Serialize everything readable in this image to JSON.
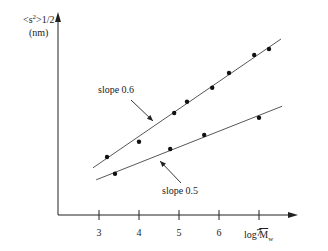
{
  "chart_data": {
    "type": "scatter",
    "title": "",
    "xlabel": "log M̄w",
    "xlabel_parts": {
      "prefix": "log ",
      "main": "M",
      "sub": "w"
    },
    "ylabel": "<s2>1/2 (nm)",
    "ylabel_parts": {
      "line1_pre": "<s",
      "line1_sup": "2",
      "line1_post": ">1/2",
      "line2": "(nm)"
    },
    "x_ticks": [
      3,
      4,
      5,
      6,
      7
    ],
    "x_tick_labels": [
      "3",
      "4",
      "5",
      "6",
      "7"
    ],
    "y_ticks": [],
    "xlim": [
      1.05,
      7.7
    ],
    "ylim_arbitrary": [
      0,
      5.0
    ],
    "grid": false,
    "legend": null,
    "series": [
      {
        "name": "slope 0.6",
        "slope": 0.6,
        "x": [
          3.2,
          4.0,
          4.88,
          5.2,
          5.83,
          6.25,
          6.88,
          7.25
        ],
        "y": [
          1.45,
          1.83,
          2.55,
          2.83,
          3.18,
          3.55,
          4.0,
          4.15
        ],
        "fit_line": {
          "x": [
            2.85,
            7.55
          ],
          "y": [
            1.18,
            4.4
          ]
        }
      },
      {
        "name": "slope 0.5",
        "slope": 0.5,
        "x": [
          3.4,
          4.78,
          5.63,
          7.0
        ],
        "y": [
          1.03,
          1.65,
          2.0,
          2.43
        ],
        "fit_line": {
          "x": [
            2.93,
            7.58
          ],
          "y": [
            0.88,
            2.72
          ]
        }
      }
    ],
    "annotations": [
      {
        "text": "slope 0.6",
        "arrow_to_series": "slope 0.6"
      },
      {
        "text": "slope 0.5",
        "arrow_to_series": "slope 0.5"
      }
    ]
  },
  "labels": {
    "slope_upper": "slope 0.6",
    "slope_lower": "slope 0.5"
  },
  "colors": {
    "ink": "#222222",
    "background": "#ffffff"
  }
}
